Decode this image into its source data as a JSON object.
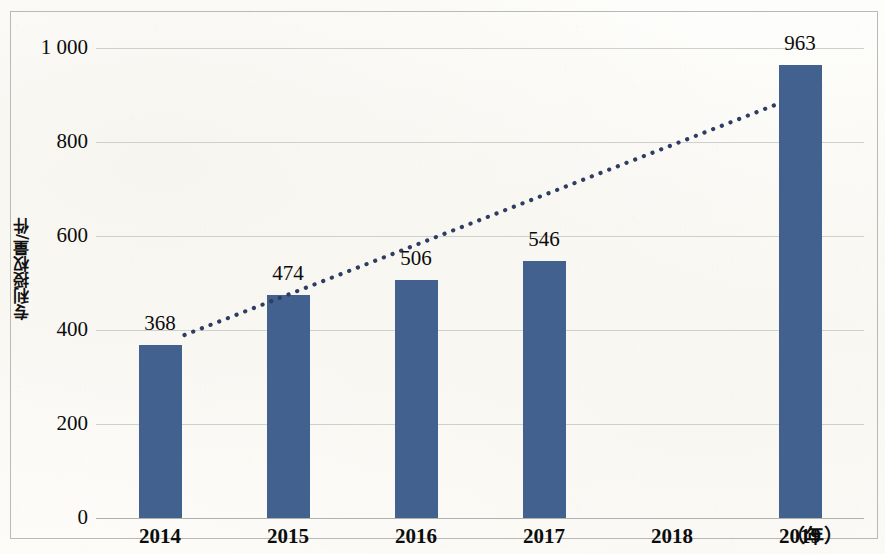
{
  "chart_data": {
    "type": "bar",
    "title": "",
    "subtitle": "",
    "xlabel": "（年）",
    "ylabel": "专利授权量/件",
    "categories": [
      "2014",
      "2015",
      "2016",
      "2017",
      "2018",
      "2019"
    ],
    "values": [
      368,
      474,
      506,
      546,
      null,
      963
    ],
    "data_labels": [
      "368",
      "474",
      "506",
      "546",
      "",
      "963"
    ],
    "ylim": [
      0,
      1000
    ],
    "y_ticks": [
      0,
      200,
      400,
      600,
      800,
      1000
    ],
    "y_tick_labels": [
      "0",
      "200",
      "400",
      "600",
      "800",
      "1 000"
    ],
    "grid": true,
    "legend": false,
    "legend_position": "none",
    "series": [
      {
        "name": "专利授权量",
        "type": "bar",
        "color": "#42618F",
        "values": [
          368,
          474,
          506,
          546,
          null,
          963
        ]
      },
      {
        "name": "趋势线",
        "type": "line",
        "style": "dotted",
        "color": "#2e3e63",
        "start": {
          "x_category": "2014",
          "y": 368
        },
        "end": {
          "x_category": "2019",
          "y": 880
        }
      }
    ]
  },
  "axes": {
    "y_title": "专利授权量/件",
    "x_unit": "（年）",
    "y_ticks": [
      {
        "value": 1000,
        "label": "1 000"
      },
      {
        "value": 800,
        "label": "800"
      },
      {
        "value": 600,
        "label": "600"
      },
      {
        "value": 400,
        "label": "400"
      },
      {
        "value": 200,
        "label": "200"
      },
      {
        "value": 0,
        "label": "0"
      }
    ],
    "x_ticks": [
      {
        "label": "2014"
      },
      {
        "label": "2015"
      },
      {
        "label": "2016"
      },
      {
        "label": "2017"
      },
      {
        "label": "2018"
      },
      {
        "label": "2019"
      }
    ]
  },
  "bars": [
    {
      "category": "2014",
      "value": 368,
      "label": "368"
    },
    {
      "category": "2015",
      "value": 474,
      "label": "474"
    },
    {
      "category": "2016",
      "value": 506,
      "label": "506"
    },
    {
      "category": "2017",
      "value": 546,
      "label": "546"
    },
    {
      "category": "2018",
      "value": null,
      "label": ""
    },
    {
      "category": "2019",
      "value": 963,
      "label": "963"
    }
  ],
  "colors": {
    "bar_fill": "#42618F",
    "trendline": "#2E3E63",
    "gridline": "#CFCFCB",
    "frame_border": "#B9B9B5",
    "text": "#0C0C0C",
    "page_background": "#FDFDFB"
  }
}
